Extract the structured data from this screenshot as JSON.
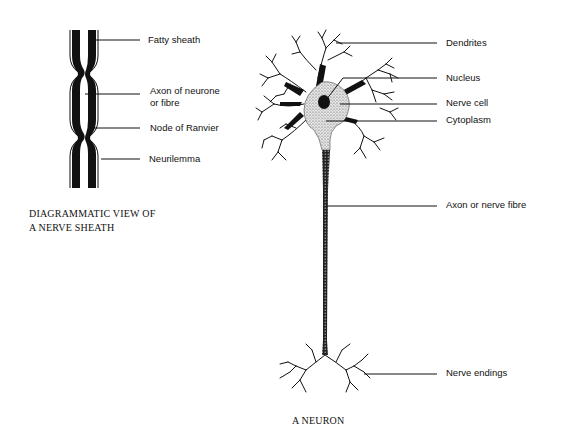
{
  "sheath_diagram": {
    "caption_line1": "DIAGRAMMATIC VIEW OF",
    "caption_line2": "A NERVE SHEATH",
    "labels": {
      "fatty_sheath": "Fatty sheath",
      "axon_line1": "Axon of neurone",
      "axon_line2": "or fibre",
      "node_of_ranvier": "Node of Ranvier",
      "neurilemma": "Neurilemma"
    }
  },
  "neuron_diagram": {
    "caption": "A NEURON",
    "labels": {
      "dendrites": "Dendrites",
      "nucleus": "Nucleus",
      "nerve_cell": "Nerve cell",
      "cytoplasm": "Cytoplasm",
      "axon": "Axon or nerve fibre",
      "nerve_endings": "Nerve endings"
    }
  },
  "colors": {
    "ink": "#111111",
    "background": "#ffffff",
    "stipple": "#9a9a9a"
  }
}
